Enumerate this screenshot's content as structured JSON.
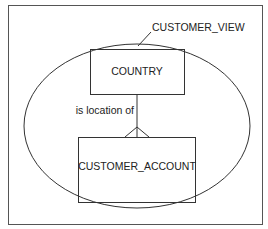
{
  "diagram": {
    "view_label": "CUSTOMER_VIEW",
    "entities": [
      {
        "name": "COUNTRY"
      },
      {
        "name": "CUSTOMER_ACCOUNT"
      }
    ],
    "relationship": {
      "label": "is location of",
      "from": "COUNTRY",
      "to": "CUSTOMER_ACCOUNT",
      "cardinality": "one-to-many"
    },
    "colors": {
      "stroke": "#333333",
      "background": "#ffffff"
    }
  }
}
